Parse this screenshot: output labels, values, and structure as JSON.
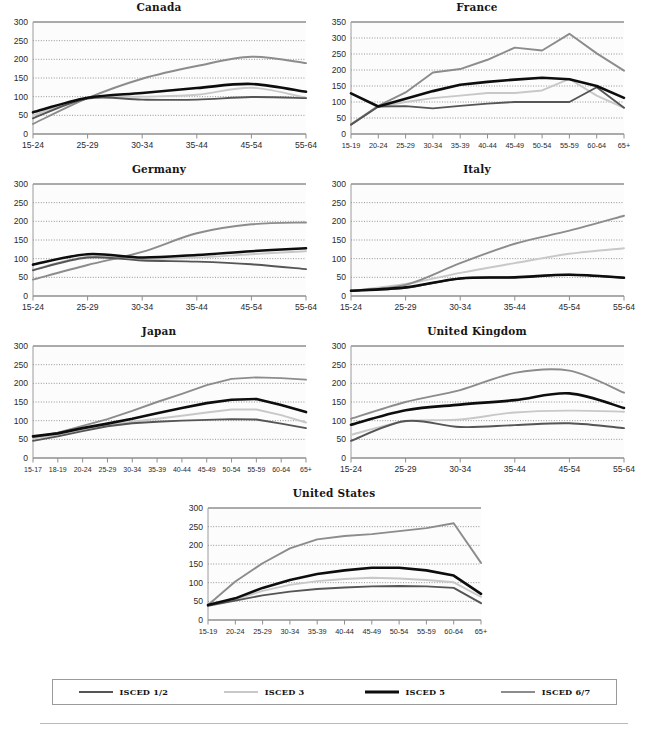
{
  "legend": {
    "items": [
      {
        "label": "ISCED 1/2",
        "color": "#555555",
        "width": 2.2
      },
      {
        "label": "ISCED 3",
        "color": "#c8c8c8",
        "width": 2.2
      },
      {
        "label": "ISCED 5",
        "color": "#0d0d0d",
        "width": 2.8
      },
      {
        "label": "ISCED 6/7",
        "color": "#8c8c8c",
        "width": 2.2
      }
    ]
  },
  "series_names": [
    "ISCED 1/2",
    "ISCED 3",
    "ISCED 5",
    "ISCED 6/7"
  ],
  "series_colors": {
    "ISCED 1/2": "#555555",
    "ISCED 3": "#c8c8c8",
    "ISCED 5": "#0d0d0d",
    "ISCED 6/7": "#8c8c8c"
  },
  "axis": {
    "ylabel": "",
    "xlabel": "",
    "grid": true,
    "yticks_300": [
      0,
      50,
      100,
      150,
      200,
      250,
      300
    ],
    "yticks_350": [
      0,
      50,
      100,
      150,
      200,
      250,
      300,
      350
    ]
  },
  "chart_data": [
    {
      "type": "line",
      "title": "Canada",
      "xlabel": "",
      "ylabel": "",
      "ylim": [
        0,
        300
      ],
      "yticks": [
        0,
        50,
        100,
        150,
        200,
        250,
        300
      ],
      "grid": true,
      "legend_position": "bottom-shared",
      "categories": [
        "15-24",
        "25-29",
        "30-34",
        "35-44",
        "45-54",
        "55-64"
      ],
      "series": [
        {
          "name": "ISCED 1/2",
          "values": [
            42,
            95,
            92,
            92,
            99,
            96
          ]
        },
        {
          "name": "ISCED 3",
          "values": [
            50,
            97,
            100,
            105,
            124,
            97
          ]
        },
        {
          "name": "ISCED 5",
          "values": [
            58,
            97,
            110,
            123,
            134,
            113
          ]
        },
        {
          "name": "ISCED 6/7",
          "values": [
            27,
            96,
            148,
            182,
            207,
            190
          ]
        }
      ]
    },
    {
      "type": "line",
      "title": "France",
      "xlabel": "",
      "ylabel": "",
      "ylim": [
        0,
        350
      ],
      "yticks": [
        0,
        50,
        100,
        150,
        200,
        250,
        300,
        350
      ],
      "grid": true,
      "legend_position": "bottom-shared",
      "categories": [
        "15-19",
        "20-24",
        "25-29",
        "30-34",
        "35-39",
        "40-44",
        "45-49",
        "50-54",
        "55-59",
        "60-64",
        "65+"
      ],
      "series": [
        {
          "name": "ISCED 1/2",
          "values": [
            29,
            86,
            87,
            80,
            88,
            95,
            100,
            100,
            100,
            146,
            82
          ]
        },
        {
          "name": "ISCED 3",
          "values": [
            30,
            85,
            100,
            112,
            120,
            128,
            128,
            136,
            172,
            120,
            82
          ]
        },
        {
          "name": "ISCED 5",
          "values": [
            127,
            86,
            110,
            134,
            154,
            163,
            170,
            176,
            171,
            150,
            113
          ]
        },
        {
          "name": "ISCED 6/7",
          "values": [
            30,
            88,
            130,
            192,
            203,
            232,
            270,
            261,
            313,
            252,
            198
          ]
        }
      ]
    },
    {
      "type": "line",
      "title": "Germany",
      "xlabel": "",
      "ylabel": "",
      "ylim": [
        0,
        300
      ],
      "yticks": [
        0,
        50,
        100,
        150,
        200,
        250,
        300
      ],
      "grid": true,
      "legend_position": "bottom-shared",
      "categories": [
        "15-24",
        "25-29",
        "30-34",
        "35-44",
        "45-54",
        "55-64"
      ],
      "series": [
        {
          "name": "ISCED 1/2",
          "values": [
            69,
            103,
            95,
            92,
            85,
            72
          ]
        },
        {
          "name": "ISCED 3",
          "values": [
            70,
            105,
            99,
            103,
            112,
            120
          ]
        },
        {
          "name": "ISCED 5",
          "values": [
            84,
            112,
            103,
            110,
            120,
            128
          ]
        },
        {
          "name": "ISCED 6/7",
          "values": [
            44,
            83,
            118,
            168,
            192,
            197
          ]
        }
      ]
    },
    {
      "type": "line",
      "title": "Italy",
      "xlabel": "",
      "ylabel": "",
      "ylim": [
        0,
        300
      ],
      "yticks": [
        0,
        50,
        100,
        150,
        200,
        250,
        300
      ],
      "grid": true,
      "legend_position": "bottom-shared",
      "categories": [
        "15-24",
        "25-29",
        "30-34",
        "35-44",
        "45-54",
        "55-64"
      ],
      "series": [
        {
          "name": "ISCED 1/2",
          "values": [
            14,
            22,
            47,
            50,
            57,
            49
          ]
        },
        {
          "name": "ISCED 3",
          "values": [
            14,
            32,
            62,
            88,
            113,
            128
          ]
        },
        {
          "name": "ISCED 5",
          "values": [
            14,
            23,
            47,
            50,
            57,
            49
          ]
        },
        {
          "name": "ISCED 6/7",
          "values": [
            14,
            30,
            88,
            140,
            175,
            215
          ]
        }
      ]
    },
    {
      "type": "line",
      "title": "Japan",
      "xlabel": "",
      "ylabel": "",
      "ylim": [
        0,
        300
      ],
      "yticks": [
        0,
        50,
        100,
        150,
        200,
        250,
        300
      ],
      "grid": true,
      "legend_position": "bottom-shared",
      "categories": [
        "15-17",
        "18-19",
        "20-24",
        "25-29",
        "30-34",
        "35-39",
        "40-44",
        "45-49",
        "50-54",
        "55-59",
        "60-64",
        "65+"
      ],
      "series": [
        {
          "name": "ISCED 1/2",
          "values": [
            46,
            58,
            72,
            85,
            93,
            97,
            100,
            102,
            104,
            103,
            92,
            80
          ]
        },
        {
          "name": "ISCED 3",
          "values": [
            52,
            62,
            76,
            88,
            97,
            105,
            113,
            122,
            130,
            130,
            115,
            95
          ]
        },
        {
          "name": "ISCED 5",
          "values": [
            58,
            66,
            80,
            92,
            105,
            120,
            134,
            147,
            156,
            158,
            142,
            123
          ]
        },
        {
          "name": "ISCED 6/7",
          "values": [
            56,
            68,
            86,
            104,
            126,
            150,
            172,
            195,
            212,
            216,
            214,
            210
          ]
        }
      ]
    },
    {
      "type": "line",
      "title": "United Kingdom",
      "xlabel": "",
      "ylabel": "",
      "ylim": [
        0,
        300
      ],
      "yticks": [
        0,
        50,
        100,
        150,
        200,
        250,
        300
      ],
      "grid": true,
      "legend_position": "bottom-shared",
      "categories": [
        "15-24",
        "25-29",
        "30-34",
        "35-44",
        "45-54",
        "55-64"
      ],
      "series": [
        {
          "name": "ISCED 1/2",
          "values": [
            46,
            99,
            83,
            88,
            93,
            80
          ]
        },
        {
          "name": "ISCED 3",
          "values": [
            62,
            98,
            103,
            122,
            127,
            124
          ]
        },
        {
          "name": "ISCED 5",
          "values": [
            89,
            128,
            143,
            155,
            173,
            134
          ]
        },
        {
          "name": "ISCED 6/7",
          "values": [
            105,
            150,
            182,
            228,
            234,
            175
          ]
        }
      ]
    },
    {
      "type": "line",
      "title": "United States",
      "xlabel": "",
      "ylabel": "",
      "ylim": [
        0,
        300
      ],
      "yticks": [
        0,
        50,
        100,
        150,
        200,
        250,
        300
      ],
      "grid": true,
      "legend_position": "bottom-shared",
      "categories": [
        "15-19",
        "20-24",
        "25-29",
        "30-34",
        "35-39",
        "40-44",
        "45-49",
        "50-54",
        "55-59",
        "60-64",
        "65+"
      ],
      "series": [
        {
          "name": "ISCED 1/2",
          "values": [
            38,
            52,
            66,
            76,
            83,
            87,
            90,
            91,
            90,
            86,
            45
          ]
        },
        {
          "name": "ISCED 3",
          "values": [
            42,
            55,
            78,
            94,
            104,
            110,
            113,
            111,
            107,
            101,
            62
          ]
        },
        {
          "name": "ISCED 5",
          "values": [
            40,
            58,
            86,
            107,
            123,
            133,
            140,
            140,
            133,
            119,
            70
          ]
        },
        {
          "name": "ISCED 6/7",
          "values": [
            40,
            103,
            152,
            192,
            216,
            225,
            230,
            238,
            246,
            259,
            153
          ]
        }
      ]
    }
  ]
}
